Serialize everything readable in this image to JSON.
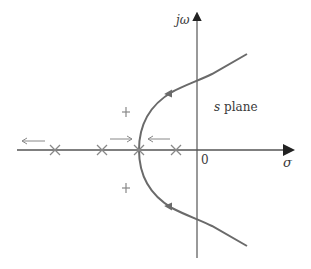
{
  "diagram": {
    "axes": {
      "vertical_label": "jω",
      "horizontal_label": "σ",
      "origin_label": "0"
    },
    "region_label": {
      "var": "s",
      "text": "plane"
    },
    "poles_on_real_axis": 4,
    "breakaway_point_marker": "x",
    "branch_markers": 2,
    "colors": {
      "axis": "#3a3a3a",
      "locus": "#6a6a6a",
      "arrow": "#7a7a7a"
    }
  }
}
